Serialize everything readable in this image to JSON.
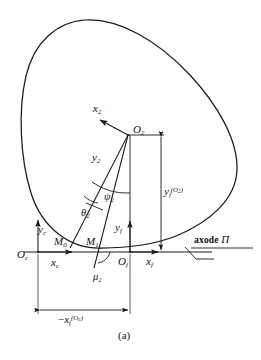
{
  "figure": {
    "caption": "(a)",
    "axode_label_text": "axode",
    "axode_label_symbol": "Π"
  },
  "labels": {
    "x2": {
      "base": "x",
      "sub": "2"
    },
    "y2": {
      "base": "y",
      "sub": "2"
    },
    "O2": {
      "base": "O",
      "sub": "2"
    },
    "xc": {
      "base": "x",
      "sub": "c"
    },
    "yc": {
      "base": "y",
      "sub": "c"
    },
    "Oc": {
      "base": "O",
      "sub": "c"
    },
    "xf": {
      "base": "x",
      "sub": "f"
    },
    "yf": {
      "base": "y",
      "sub": "f"
    },
    "Of": {
      "base": "O",
      "sub": "f"
    },
    "M0": {
      "base": "M",
      "sub": "0"
    },
    "M1": {
      "base": "M",
      "sub": "1"
    },
    "theta2": {
      "base": "θ",
      "sub": "2"
    },
    "psi2": {
      "base": "ψ",
      "sub": "2"
    },
    "mu2": {
      "base": "μ",
      "sub": "2"
    },
    "yf_O2": {
      "base": "y",
      "sub": "f",
      "sup": "(O",
      "sup_sub": "2",
      "sup_end": ")"
    },
    "neg_xf_Oc": {
      "sign": "−",
      "base": "x",
      "sub": "f",
      "sup": "(O",
      "sup_sub": "c",
      "sup_end": ")"
    }
  },
  "colors": {
    "stroke": "#1a1a1a",
    "background": "#ffffff"
  },
  "geometry": {
    "O_c": [
      38,
      252
    ],
    "O_f": [
      130,
      252
    ],
    "O_2": [
      128,
      135
    ],
    "M_0": [
      70,
      248
    ],
    "M_1": [
      101,
      248
    ],
    "curve_type": "closed convex axode contour tangent to x-axis"
  }
}
